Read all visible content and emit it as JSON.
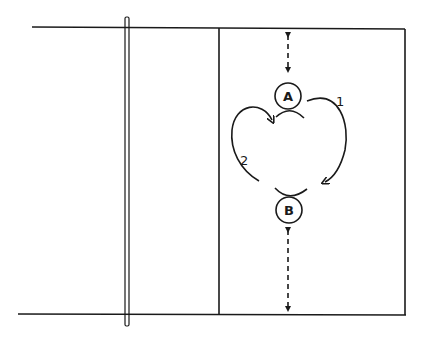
{
  "diagram": {
    "type": "volleyball-court-drill",
    "players": [
      {
        "id": "A",
        "label": "A"
      },
      {
        "id": "B",
        "label": "B"
      }
    ],
    "paths": [
      {
        "id": "1",
        "label": "1",
        "description": "curved path from A to B on the right side"
      },
      {
        "id": "2",
        "label": "2",
        "description": "curved path from B to A on the left side"
      }
    ],
    "distance_markers": [
      {
        "from": "baseline-top",
        "to": "A",
        "style": "dashed double arrow"
      },
      {
        "from": "B",
        "to": "baseline-bottom",
        "style": "dashed double arrow"
      }
    ],
    "colors": {
      "line": "#1a1a1a",
      "background": "#ffffff"
    }
  }
}
